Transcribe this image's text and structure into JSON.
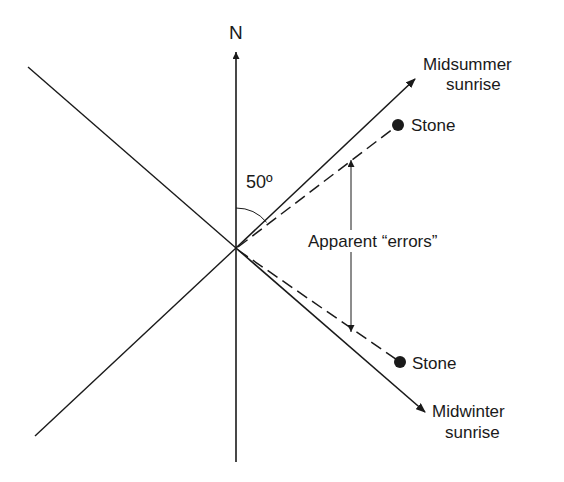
{
  "diagram": {
    "north_label": "N",
    "angle_label": "50º",
    "midsummer": {
      "line1": "Midsummer",
      "line2": "sunrise"
    },
    "midwinter": {
      "line1": "Midwinter",
      "line2": "sunrise"
    },
    "stone_upper": "Stone",
    "stone_lower": "Stone",
    "errors_label": "Apparent “errors”",
    "colors": {
      "ink": "#1a1a1a",
      "background": "#ffffff"
    }
  }
}
